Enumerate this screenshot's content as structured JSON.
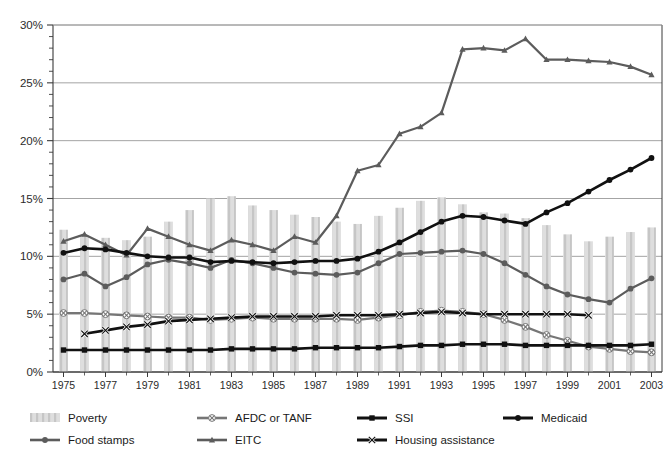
{
  "chart_data": {
    "type": "line",
    "title": "",
    "subtitle": "",
    "xlabel": "",
    "ylabel": "",
    "xlim": [
      1975,
      2004
    ],
    "ylim": [
      0,
      30
    ],
    "y_unit": "%",
    "y_major_step": 5,
    "y_minor_step": 1,
    "grid": "horizontal-major",
    "legend_position": "bottom",
    "x": [
      1975,
      1976,
      1977,
      1978,
      1979,
      1980,
      1981,
      1982,
      1983,
      1984,
      1985,
      1986,
      1987,
      1988,
      1989,
      1990,
      1991,
      1992,
      1993,
      1994,
      1995,
      1996,
      1997,
      1998,
      1999,
      2000,
      2001,
      2002,
      2003
    ],
    "xtick_labels": [
      "1975",
      "1977",
      "1979",
      "1981",
      "1983",
      "1985",
      "1987",
      "1989",
      "1991",
      "1993",
      "1995",
      "1997",
      "1999",
      "2001",
      "2003"
    ],
    "ytick_labels": [
      "0%",
      "5%",
      "10%",
      "15%",
      "20%",
      "25%",
      "30%"
    ],
    "series": [
      {
        "name": "Poverty",
        "style": "bar",
        "color": "#d9d9d9",
        "pattern": "hatch",
        "marker": "none",
        "values": [
          12.3,
          11.8,
          11.6,
          11.4,
          11.7,
          13.0,
          14.0,
          15.0,
          15.2,
          14.4,
          14.0,
          13.6,
          13.4,
          13.0,
          12.8,
          13.5,
          14.2,
          14.8,
          15.1,
          14.5,
          13.8,
          13.7,
          13.3,
          12.7,
          11.9,
          11.3,
          11.7,
          12.1,
          12.5
        ]
      },
      {
        "name": "Food stamps",
        "style": "line",
        "color": "#5c5c5c",
        "marker": "circle",
        "values": [
          8.0,
          8.5,
          7.4,
          8.2,
          9.3,
          9.7,
          9.4,
          9.0,
          9.7,
          9.4,
          9.0,
          8.6,
          8.5,
          8.4,
          8.6,
          9.4,
          10.2,
          10.3,
          10.4,
          10.5,
          10.2,
          9.4,
          8.4,
          7.4,
          6.7,
          6.3,
          6.0,
          7.2,
          8.1
        ]
      },
      {
        "name": "AFDC or TANF",
        "style": "line",
        "color": "#767676",
        "marker": "x-circle",
        "values": [
          5.1,
          5.1,
          5.0,
          4.9,
          4.8,
          4.7,
          4.7,
          4.5,
          4.6,
          4.7,
          4.6,
          4.6,
          4.6,
          4.6,
          4.5,
          4.7,
          4.9,
          5.2,
          5.3,
          5.2,
          5.0,
          4.5,
          3.9,
          3.2,
          2.7,
          2.2,
          2.0,
          1.8,
          1.7
        ]
      },
      {
        "name": "EITC",
        "style": "line",
        "color": "#5c5c5c",
        "marker": "triangle",
        "values": [
          11.3,
          11.9,
          11.0,
          10.1,
          12.4,
          11.7,
          11.0,
          10.5,
          11.4,
          11.0,
          10.5,
          11.7,
          11.2,
          13.5,
          17.4,
          17.9,
          20.6,
          21.2,
          22.4,
          27.9,
          28.0,
          27.8,
          28.8,
          27.0,
          27.0,
          26.9,
          26.8,
          26.4,
          25.7
        ]
      },
      {
        "name": "SSI",
        "style": "line",
        "color": "#111111",
        "marker": "square",
        "values": [
          1.9,
          1.9,
          1.9,
          1.9,
          1.9,
          1.9,
          1.9,
          1.9,
          2.0,
          2.0,
          2.0,
          2.0,
          2.1,
          2.1,
          2.1,
          2.1,
          2.2,
          2.3,
          2.3,
          2.4,
          2.4,
          2.4,
          2.3,
          2.3,
          2.3,
          2.3,
          2.3,
          2.3,
          2.4
        ]
      },
      {
        "name": "Housing assistance",
        "style": "line",
        "color": "#111111",
        "marker": "x",
        "values": [
          null,
          3.3,
          3.6,
          3.9,
          4.1,
          4.4,
          4.5,
          4.6,
          4.7,
          4.8,
          4.8,
          4.8,
          4.8,
          4.9,
          4.9,
          4.9,
          5.0,
          5.1,
          5.2,
          5.1,
          5.0,
          5.0,
          5.0,
          5.0,
          5.0,
          4.9,
          null,
          null,
          null
        ]
      },
      {
        "name": "Medicaid",
        "style": "line",
        "color": "#111111",
        "marker": "circle",
        "values": [
          10.3,
          10.7,
          10.6,
          10.3,
          10.0,
          9.9,
          9.9,
          9.5,
          9.6,
          9.5,
          9.4,
          9.5,
          9.6,
          9.6,
          9.8,
          10.4,
          11.2,
          12.1,
          13.0,
          13.5,
          13.4,
          13.1,
          12.8,
          13.8,
          14.6,
          15.6,
          16.6,
          17.5,
          18.5
        ]
      }
    ]
  },
  "legend": {
    "items": [
      {
        "label": "Poverty",
        "swatch": "bar-hatch",
        "color": "#d9d9d9"
      },
      {
        "label": "AFDC or TANF",
        "swatch": "line-x-circle",
        "color": "#767676"
      },
      {
        "label": "SSI",
        "swatch": "line-square",
        "color": "#111111"
      },
      {
        "label": "Medicaid",
        "swatch": "line-circle",
        "color": "#111111"
      },
      {
        "label": "Food stamps",
        "swatch": "line-circle",
        "color": "#5c5c5c"
      },
      {
        "label": "EITC",
        "swatch": "line-triangle",
        "color": "#5c5c5c"
      },
      {
        "label": "Housing assistance",
        "swatch": "line-x",
        "color": "#111111"
      }
    ]
  },
  "colors": {
    "axis": "#3a3a3a",
    "grid": "#9a9a9a",
    "bar": "#d9d9d9",
    "bar_hatch": "#c4c4c4",
    "gray_series": "#5c5c5c",
    "light_gray_series": "#767676",
    "black_series": "#111111",
    "background": "#ffffff"
  }
}
